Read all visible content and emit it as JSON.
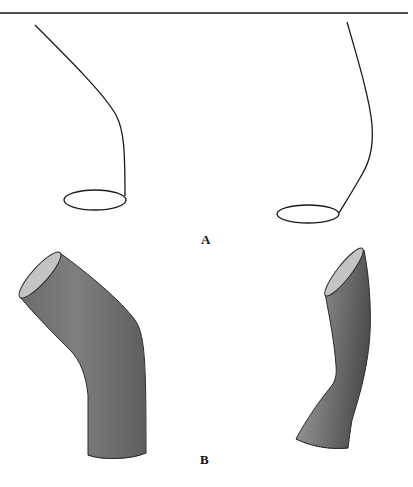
{
  "figure": {
    "panels": [
      {
        "id": "A",
        "label": "A",
        "description": "Two centerline curves each ending in an elliptical cross-section",
        "items": [
          {
            "name": "left-centerline-with-cross-section"
          },
          {
            "name": "right-centerline-with-cross-section"
          }
        ]
      },
      {
        "id": "B",
        "label": "B",
        "description": "Two swept tube surfaces generated from the curves",
        "items": [
          {
            "name": "left-swept-tube"
          },
          {
            "name": "right-swept-tube"
          }
        ]
      }
    ],
    "colors": {
      "line": "#1a1a1a",
      "tube_dark": "#5a5a5a",
      "tube_mid": "#8a8a8a",
      "tube_light": "#b4b4b4",
      "cap": "#c8c8c8"
    }
  }
}
